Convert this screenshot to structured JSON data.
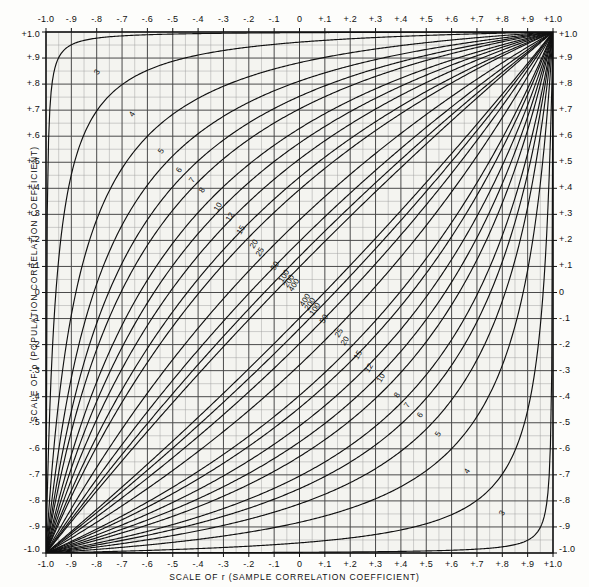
{
  "figure": {
    "x_axis_caption": "SCALE OF r (SAMPLE CORRELATION COEFFICIENT)",
    "y_axis_caption": "SCALE OF ρ (POPULATION CORRELATION COEFFICIENT)",
    "ink_color": "#111111",
    "grid_color": "#4a4a4a",
    "minor_grid_color": "#9a9a9a",
    "background_color": "#f4f4f0"
  },
  "chart_data": {
    "type": "line",
    "title": "",
    "xlabel": "SCALE OF r (SAMPLE CORRELATION COEFFICIENT)",
    "ylabel": "SCALE OF ρ (POPULATION CORRELATION COEFFICIENT)",
    "xlim": [
      -1.0,
      1.0
    ],
    "ylim": [
      -1.0,
      1.0
    ],
    "grid": true,
    "legend_position": "none",
    "annotation": "Confidence belts for the correlation coefficient; curves labelled by sample size n. Confidence coefficient 0.95.",
    "x_tick_values": [
      -1.0,
      -0.9,
      -0.8,
      -0.7,
      -0.6,
      -0.5,
      -0.4,
      -0.3,
      -0.2,
      -0.1,
      0,
      0.1,
      0.2,
      0.3,
      0.4,
      0.5,
      0.6,
      0.7,
      0.8,
      0.9,
      1.0
    ],
    "x_tick_labels": [
      "-1.0",
      "-.9",
      "-.8",
      "-.7",
      "-.6",
      "-.5",
      "-.4",
      "-.3",
      "-.2",
      "-.1",
      "0",
      "+.1",
      "+.2",
      "+.3",
      "+.4",
      "+.5",
      "+.6",
      "+.7",
      "+.8",
      "+.9",
      "+1.0"
    ],
    "y_tick_values": [
      1.0,
      0.9,
      0.8,
      0.7,
      0.6,
      0.5,
      0.4,
      0.3,
      0.2,
      0.1,
      0,
      -0.1,
      -0.2,
      -0.3,
      -0.4,
      -0.5,
      -0.6,
      -0.7,
      -0.8,
      -0.9,
      -1.0
    ],
    "y_tick_labels": [
      "+1.0",
      "+.9",
      "+.8",
      "+.7",
      "+.6",
      "+.5",
      "+.4",
      "+.3",
      "+.2",
      "+.1",
      "0",
      "-.1",
      "-.2",
      "-.3",
      "-.4",
      "-.5",
      "-.6",
      "-.7",
      "-.8",
      "-.9",
      "-1.0"
    ],
    "minor_step": 0.05,
    "major_step": 0.1,
    "sample_sizes": [
      3,
      4,
      5,
      6,
      7,
      8,
      10,
      12,
      15,
      20,
      25,
      50,
      100,
      200,
      400
    ],
    "upper_labels": [
      {
        "n": 3,
        "x": -0.8,
        "y": 0.845
      },
      {
        "n": 4,
        "x": -0.66,
        "y": 0.685
      },
      {
        "n": 5,
        "x": -0.545,
        "y": 0.545
      },
      {
        "n": 6,
        "x": -0.475,
        "y": 0.47
      },
      {
        "n": 7,
        "x": -0.425,
        "y": 0.43
      },
      {
        "n": 8,
        "x": -0.385,
        "y": 0.395
      },
      {
        "n": 10,
        "x": -0.32,
        "y": 0.33
      },
      {
        "n": 12,
        "x": -0.275,
        "y": 0.29
      },
      {
        "n": 15,
        "x": -0.23,
        "y": 0.24
      },
      {
        "n": 20,
        "x": -0.18,
        "y": 0.185
      },
      {
        "n": 25,
        "x": -0.155,
        "y": 0.155
      },
      {
        "n": 50,
        "x": -0.095,
        "y": 0.1
      },
      {
        "n": 100,
        "x": -0.06,
        "y": 0.065
      },
      {
        "n": 200,
        "x": -0.04,
        "y": 0.045
      },
      {
        "n": 400,
        "x": -0.022,
        "y": 0.028
      }
    ],
    "lower_labels": [
      {
        "n": 400,
        "x": 0.022,
        "y": -0.028
      },
      {
        "n": 200,
        "x": 0.04,
        "y": -0.045
      },
      {
        "n": 100,
        "x": 0.06,
        "y": -0.065
      },
      {
        "n": 50,
        "x": 0.095,
        "y": -0.1
      },
      {
        "n": 25,
        "x": 0.155,
        "y": -0.155
      },
      {
        "n": 20,
        "x": 0.18,
        "y": -0.185
      },
      {
        "n": 15,
        "x": 0.23,
        "y": -0.24
      },
      {
        "n": 12,
        "x": 0.275,
        "y": -0.29
      },
      {
        "n": 10,
        "x": 0.32,
        "y": -0.33
      },
      {
        "n": 8,
        "x": 0.385,
        "y": -0.395
      },
      {
        "n": 7,
        "x": 0.425,
        "y": -0.43
      },
      {
        "n": 6,
        "x": 0.475,
        "y": -0.47
      },
      {
        "n": 5,
        "x": 0.545,
        "y": -0.545
      },
      {
        "n": 4,
        "x": 0.66,
        "y": -0.685
      },
      {
        "n": 3,
        "x": 0.8,
        "y": -0.845
      }
    ]
  }
}
